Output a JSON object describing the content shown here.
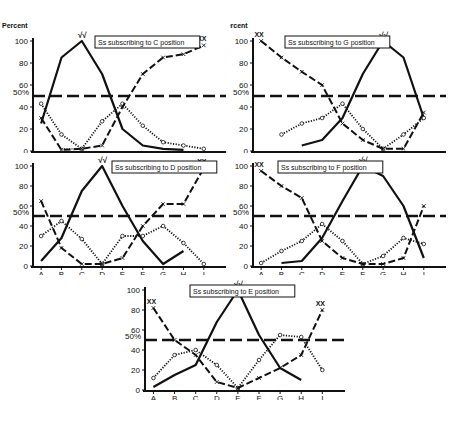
{
  "figure": {
    "ylabel": "Percent",
    "y_ticks": [
      "0",
      "20",
      "40",
      "60",
      "80",
      "100"
    ],
    "fifty_label": "50%",
    "x_categories": [
      "A",
      "B",
      "C",
      "D",
      "E",
      "F",
      "G",
      "H",
      "I"
    ],
    "peak_marker": "√√",
    "xx_marker": "XX",
    "colors": {
      "ink": "#111111",
      "background": "#ffffff"
    }
  },
  "chart_data": [
    {
      "type": "line",
      "title": "Ss subscribing to C position",
      "categories": [
        "A",
        "B",
        "C",
        "D",
        "E",
        "F",
        "G",
        "H",
        "I"
      ],
      "ylabel": "Percent",
      "ylim": [
        0,
        100
      ],
      "reference_line": 50,
      "series": [
        {
          "name": "solid",
          "style": "solid",
          "values": [
            25,
            85,
            100,
            70,
            20,
            5,
            2,
            1,
            null
          ]
        },
        {
          "name": "dotted-circles",
          "style": "dotted",
          "values": [
            43,
            15,
            2,
            27,
            43,
            23,
            8,
            5,
            2
          ]
        },
        {
          "name": "dashed-x",
          "style": "dashed",
          "values": [
            30,
            1,
            2,
            5,
            40,
            70,
            85,
            88,
            96
          ]
        },
        {
          "name": "dotted-fine",
          "style": "fine-dotted",
          "values": [
            null,
            2,
            2,
            null,
            null,
            null,
            null,
            null,
            null
          ]
        }
      ]
    },
    {
      "type": "line",
      "title": "Ss subscribing to G position",
      "categories": [
        "A",
        "B",
        "C",
        "D",
        "E",
        "F",
        "G",
        "H",
        "I"
      ],
      "ylabel": "Percent",
      "ylim": [
        0,
        100
      ],
      "reference_line": 50,
      "series": [
        {
          "name": "solid",
          "style": "solid",
          "values": [
            null,
            null,
            5,
            10,
            30,
            70,
            100,
            85,
            30
          ]
        },
        {
          "name": "dotted-circles",
          "style": "dotted",
          "values": [
            null,
            15,
            25,
            30,
            43,
            20,
            2,
            15,
            30
          ]
        },
        {
          "name": "dashed-x",
          "style": "dashed",
          "values": [
            100,
            85,
            72,
            60,
            25,
            10,
            2,
            2,
            35
          ]
        }
      ]
    },
    {
      "type": "line",
      "title": "Ss subscribing to D position",
      "categories": [
        "A",
        "B",
        "C",
        "D",
        "E",
        "F",
        "G",
        "H",
        "I"
      ],
      "ylabel": "Percent",
      "ylim": [
        0,
        100
      ],
      "reference_line": 50,
      "series": [
        {
          "name": "solid",
          "style": "solid",
          "values": [
            5,
            28,
            75,
            100,
            60,
            25,
            2,
            15,
            null
          ]
        },
        {
          "name": "dotted-circles",
          "style": "dotted",
          "values": [
            30,
            45,
            27,
            2,
            30,
            30,
            40,
            23,
            2
          ]
        },
        {
          "name": "dashed-x",
          "style": "dashed",
          "values": [
            65,
            18,
            2,
            2,
            8,
            40,
            62,
            62,
            98
          ]
        }
      ]
    },
    {
      "type": "line",
      "title": "Ss subscribing to F position",
      "categories": [
        "A",
        "B",
        "C",
        "D",
        "E",
        "F",
        "G",
        "H",
        "I"
      ],
      "ylabel": "Percent",
      "ylim": [
        0,
        100
      ],
      "reference_line": 50,
      "series": [
        {
          "name": "solid",
          "style": "solid",
          "values": [
            null,
            3,
            5,
            28,
            65,
            100,
            90,
            60,
            8
          ]
        },
        {
          "name": "dotted-circles",
          "style": "dotted",
          "values": [
            3,
            15,
            25,
            42,
            25,
            2,
            10,
            28,
            22
          ]
        },
        {
          "name": "dashed-x",
          "style": "dashed",
          "values": [
            95,
            80,
            68,
            25,
            8,
            2,
            2,
            8,
            60
          ]
        }
      ]
    },
    {
      "type": "line",
      "title": "Ss subscribing to E position",
      "categories": [
        "A",
        "B",
        "C",
        "D",
        "E",
        "F",
        "G",
        "H",
        "I"
      ],
      "ylabel": "Percent",
      "ylim": [
        0,
        100
      ],
      "reference_line": 50,
      "series": [
        {
          "name": "solid",
          "style": "solid",
          "values": [
            3,
            15,
            25,
            68,
            100,
            55,
            22,
            10,
            null
          ]
        },
        {
          "name": "dotted-circles",
          "style": "dotted",
          "values": [
            12,
            35,
            40,
            25,
            2,
            30,
            55,
            53,
            20
          ]
        },
        {
          "name": "dashed-x",
          "style": "dashed",
          "values": [
            82,
            50,
            35,
            8,
            2,
            12,
            22,
            35,
            80
          ]
        }
      ]
    }
  ]
}
